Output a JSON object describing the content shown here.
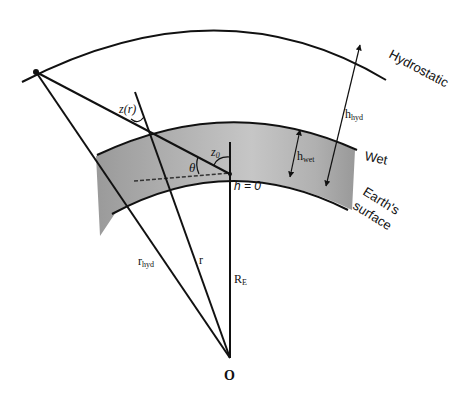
{
  "diagram": {
    "layers": {
      "hydrostatic": "Hydrostatic",
      "wet": "Wet",
      "earth_surface_line1": "Earth's",
      "earth_surface_line2": "surface"
    },
    "symbols": {
      "h_hyd": "h",
      "h_hyd_sub": "hyd",
      "h_wet": "h",
      "h_wet_sub": "wet",
      "h_zero": "h = 0",
      "z_r": "z(r)",
      "z_0": "z",
      "z_0_sub": "0",
      "theta": "θ",
      "r_hyd": "r",
      "r_hyd_sub": "hyd",
      "r": "r",
      "R_E": "R",
      "R_E_sub": "E",
      "origin": "O"
    },
    "colors": {
      "line": "#111111",
      "wet_layer_fill": "#a9a9a9",
      "background": "#ffffff"
    }
  }
}
